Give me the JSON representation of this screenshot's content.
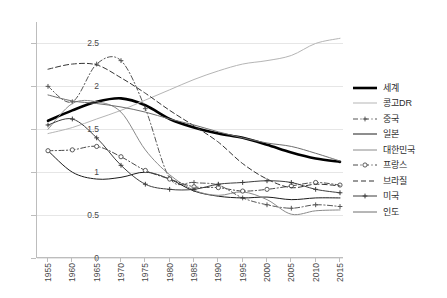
{
  "chart_data": {
    "type": "line",
    "title": "",
    "xlabel": "",
    "ylabel": "",
    "xlim": [
      1955,
      2015
    ],
    "ylim": [
      0,
      2.75
    ],
    "yticks": [
      "0",
      "0.5",
      "1",
      "1.5",
      "2",
      "2.5"
    ],
    "ytick_values": [
      0,
      0.5,
      1,
      1.5,
      2,
      2.5
    ],
    "grid": "horizontal",
    "legend_position": "right",
    "x": [
      1955,
      1960,
      1965,
      1970,
      1975,
      1980,
      1985,
      1990,
      1995,
      2000,
      2005,
      2010,
      2015
    ],
    "xticklabels": [
      "1955",
      "1960",
      "1965",
      "1970",
      "1975",
      "1980",
      "1985",
      "1990",
      "1995",
      "2000",
      "2005",
      "2010",
      "2015"
    ],
    "series": [
      {
        "name": "세계",
        "style": "solid-thick",
        "color": "#000000",
        "marker": "none",
        "values": [
          1.6,
          1.72,
          1.82,
          1.86,
          1.78,
          1.62,
          1.52,
          1.45,
          1.4,
          1.32,
          1.23,
          1.16,
          1.12
        ]
      },
      {
        "name": "콩고DR",
        "style": "solid",
        "color": "#b5b5b5",
        "marker": "none",
        "values": [
          1.45,
          1.52,
          1.62,
          1.72,
          1.84,
          1.96,
          2.08,
          2.18,
          2.26,
          2.3,
          2.36,
          2.5,
          2.56
        ]
      },
      {
        "name": "중국",
        "style": "dashdot",
        "color": "#555555",
        "marker": "plus",
        "values": [
          2.0,
          1.82,
          2.26,
          2.3,
          1.74,
          0.93,
          0.88,
          0.85,
          0.7,
          0.62,
          0.58,
          0.62,
          0.6
        ]
      },
      {
        "name": "일본",
        "style": "solid",
        "color": "#1c1c1c",
        "marker": "none",
        "values": [
          1.25,
          1.0,
          0.92,
          0.94,
          1.0,
          0.92,
          0.78,
          0.72,
          0.7,
          0.71,
          0.68,
          0.7,
          0.7
        ]
      },
      {
        "name": "대한민국",
        "style": "solid",
        "color": "#8a8a8a",
        "marker": "none",
        "values": [
          1.5,
          1.8,
          1.82,
          1.7,
          1.26,
          0.97,
          0.79,
          0.73,
          0.77,
          0.68,
          0.51,
          0.55,
          0.56
        ]
      },
      {
        "name": "프랑스",
        "style": "dashdot",
        "color": "#4a4a4a",
        "marker": "circle",
        "values": [
          1.25,
          1.26,
          1.3,
          1.18,
          1.02,
          0.92,
          0.83,
          0.82,
          0.78,
          0.8,
          0.84,
          0.88,
          0.85
        ]
      },
      {
        "name": "브라질",
        "style": "dashed",
        "color": "#333333",
        "marker": "none",
        "values": [
          2.2,
          2.26,
          2.25,
          2.1,
          1.92,
          1.72,
          1.54,
          1.35,
          1.1,
          0.92,
          0.82,
          0.86,
          0.84
        ]
      },
      {
        "name": "미국",
        "style": "solid",
        "color": "#3d3d3d",
        "marker": "plus",
        "values": [
          1.55,
          1.62,
          1.4,
          1.08,
          0.86,
          0.8,
          0.8,
          0.86,
          0.88,
          0.9,
          0.88,
          0.8,
          0.76
        ]
      },
      {
        "name": "인도",
        "style": "solid",
        "color": "#6e6e6e",
        "marker": "none",
        "values": [
          1.9,
          1.83,
          1.8,
          1.76,
          1.7,
          1.62,
          1.55,
          1.47,
          1.4,
          1.34,
          1.3,
          1.22,
          1.13
        ]
      }
    ]
  },
  "legend": {
    "items": [
      {
        "label": "세계"
      },
      {
        "label": "콩고DR"
      },
      {
        "label": "중국"
      },
      {
        "label": "일본"
      },
      {
        "label": "대한민국"
      },
      {
        "label": "프랑스"
      },
      {
        "label": "브라질"
      },
      {
        "label": "미국"
      },
      {
        "label": "인도"
      }
    ]
  }
}
